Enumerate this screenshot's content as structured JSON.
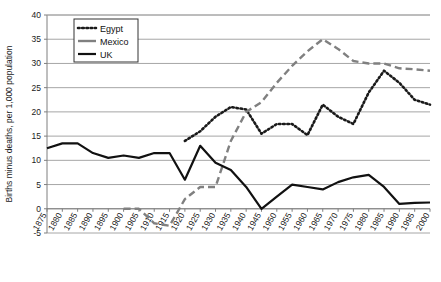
{
  "chart_data": {
    "type": "line",
    "title": "",
    "xlabel": "",
    "ylabel": "Births minus deaths, per 1,000 population",
    "ylim": [
      -5,
      40
    ],
    "ytick_labels": [
      "40",
      "35",
      "30",
      "25",
      "20",
      "15",
      "10",
      "5",
      "0",
      "-5"
    ],
    "ytick_values": [
      40,
      35,
      30,
      25,
      20,
      15,
      10,
      5,
      0,
      -5
    ],
    "grid": true,
    "legend_position": "top-left",
    "categories": [
      "1875",
      "1880",
      "1885",
      "1890",
      "1895",
      "1900",
      "1905",
      "1910",
      "1915",
      "1920",
      "1925",
      "1930",
      "1935",
      "1940",
      "1945",
      "1950",
      "1955",
      "1960",
      "1965",
      "1970",
      "1975",
      "1980",
      "1985",
      "1990",
      "1995",
      "2000"
    ],
    "series": [
      {
        "name": "Egypt",
        "style": "dotted",
        "color": "#1a1a1a",
        "values": [
          null,
          null,
          null,
          null,
          null,
          null,
          null,
          null,
          null,
          14.0,
          16.0,
          19.0,
          21.0,
          20.5,
          15.5,
          17.5,
          17.5,
          15.2,
          21.5,
          19.0,
          17.5,
          24.0,
          28.5,
          26.0,
          22.5,
          21.5
        ]
      },
      {
        "name": "Mexico",
        "style": "dashed",
        "color": "#808080",
        "values": [
          null,
          null,
          null,
          null,
          null,
          0.0,
          0.0,
          -3.0,
          -3.5,
          2.0,
          4.5,
          4.5,
          14.0,
          20.0,
          22.0,
          26.0,
          29.5,
          32.5,
          35.0,
          33.0,
          30.5,
          30.0,
          30.0,
          29.0,
          28.8,
          28.5
        ]
      },
      {
        "name": "UK",
        "style": "solid",
        "color": "#111111",
        "values": [
          12.5,
          13.5,
          13.5,
          11.5,
          10.5,
          11.0,
          10.5,
          11.5,
          11.5,
          6.0,
          13.0,
          9.5,
          8.0,
          4.5,
          0.0,
          2.5,
          5.0,
          4.5,
          4.0,
          5.5,
          6.5,
          7.0,
          4.5,
          1.0,
          1.2,
          1.3
        ]
      }
    ],
    "annotations": []
  },
  "legend": {
    "items": [
      {
        "label": "Egypt"
      },
      {
        "label": "Mexico"
      },
      {
        "label": "UK"
      }
    ]
  },
  "colors": {
    "egypt": "#1a1a1a",
    "mexico": "#808080",
    "uk": "#111111",
    "grid": "#a6a6a6",
    "axis": "#7f7f7f",
    "background": "#ffffff"
  }
}
